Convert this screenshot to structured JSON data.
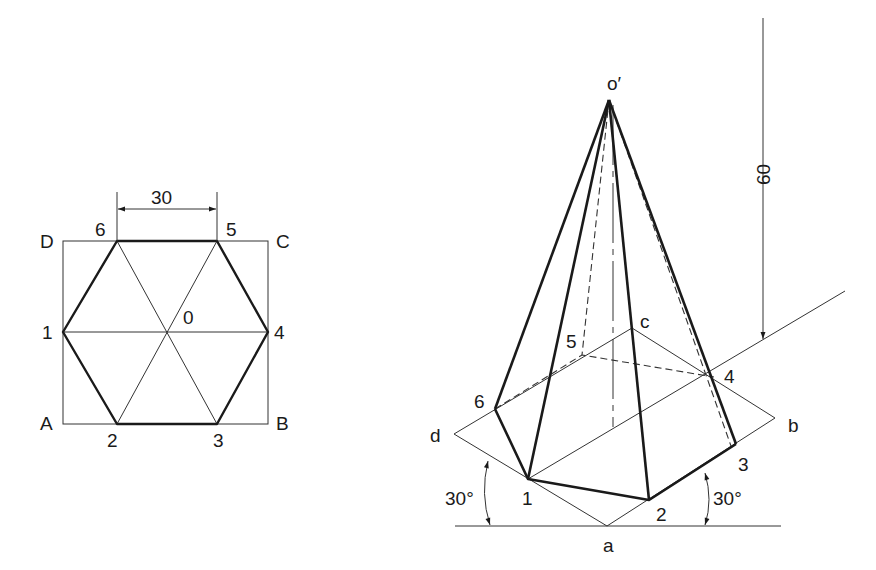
{
  "plan_view": {
    "corner_labels": {
      "A": "A",
      "B": "B",
      "C": "C",
      "D": "D"
    },
    "vertex_labels": {
      "v1": "1",
      "v2": "2",
      "v3": "3",
      "v4": "4",
      "v5": "5",
      "v6": "6"
    },
    "center_label": "0",
    "dimension": "30"
  },
  "isometric_view": {
    "apex_label": "o′",
    "base_corner_labels": {
      "a": "a",
      "b": "b",
      "c": "c",
      "d": "d"
    },
    "vertex_labels": {
      "v1": "1",
      "v2": "2",
      "v3": "3",
      "v4": "4",
      "v5": "5",
      "v6": "6"
    },
    "height_dimension": "60",
    "angle_left": "30°",
    "angle_right": "30°"
  },
  "colors": {
    "line": "#1a1a1a",
    "background": "#ffffff"
  }
}
